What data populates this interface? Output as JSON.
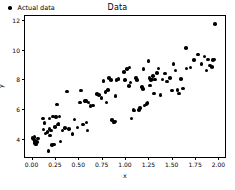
{
  "chart_data": {
    "type": "scatter",
    "title": "Data",
    "xlabel": "x",
    "ylabel": "y",
    "xlim": [
      -0.07,
      2.07
    ],
    "ylim": [
      2.75,
      12.3
    ],
    "grid": false,
    "legend": {
      "position": "upper left",
      "entries": [
        "Actual data"
      ]
    },
    "xticks": [
      0.0,
      0.25,
      0.5,
      0.75,
      1.0,
      1.25,
      1.5,
      1.75,
      2.0
    ],
    "xticklabels": [
      "0.00",
      "0.25",
      "0.50",
      "0.75",
      "1.00",
      "1.25",
      "1.50",
      "1.75",
      "2.00"
    ],
    "yticks": [
      4,
      6,
      8,
      10,
      12
    ],
    "yticklabels": [
      "4",
      "6",
      "8",
      "10",
      "12"
    ],
    "marker": "circle",
    "marker_color": "#000000",
    "series": [
      {
        "name": "Actual data",
        "x": [
          0.01,
          0.02,
          0.03,
          0.03,
          0.04,
          0.05,
          0.06,
          0.07,
          0.12,
          0.13,
          0.14,
          0.15,
          0.17,
          0.18,
          0.19,
          0.19,
          0.2,
          0.21,
          0.22,
          0.23,
          0.24,
          0.25,
          0.26,
          0.27,
          0.28,
          0.29,
          0.3,
          0.31,
          0.33,
          0.36,
          0.38,
          0.4,
          0.44,
          0.46,
          0.49,
          0.52,
          0.53,
          0.55,
          0.57,
          0.58,
          0.59,
          0.6,
          0.61,
          0.63,
          0.66,
          0.7,
          0.72,
          0.75,
          0.77,
          0.79,
          0.8,
          0.82,
          0.83,
          0.85,
          0.86,
          0.88,
          0.89,
          0.9,
          0.91,
          0.93,
          0.99,
          1.0,
          1.02,
          1.04,
          1.05,
          1.06,
          1.07,
          1.09,
          1.1,
          1.12,
          1.13,
          1.15,
          1.16,
          1.18,
          1.19,
          1.2,
          1.21,
          1.23,
          1.24,
          1.25,
          1.26,
          1.27,
          1.28,
          1.29,
          1.3,
          1.31,
          1.32,
          1.34,
          1.36,
          1.38,
          1.4,
          1.43,
          1.45,
          1.48,
          1.5,
          1.52,
          1.54,
          1.56,
          1.58,
          1.6,
          1.62,
          1.65,
          1.66,
          1.7,
          1.74,
          1.78,
          1.82,
          1.85,
          1.87,
          1.89,
          1.91,
          1.93,
          1.94,
          1.95,
          1.96
        ],
        "y": [
          4.05,
          3.95,
          4.1,
          3.7,
          3.85,
          3.6,
          3.75,
          4.0,
          5.35,
          4.6,
          5.05,
          4.35,
          4.45,
          3.15,
          5.35,
          4.65,
          4.2,
          4.55,
          3.55,
          5.5,
          3.6,
          4.8,
          5.45,
          6.3,
          4.95,
          5.0,
          5.5,
          3.8,
          4.55,
          4.7,
          7.2,
          4.65,
          4.3,
          5.3,
          4.75,
          6.45,
          7.25,
          4.95,
          6.55,
          6.55,
          5.1,
          4.55,
          6.45,
          6.2,
          6.25,
          7.0,
          6.95,
          6.75,
          7.9,
          7.15,
          6.45,
          7.3,
          8.1,
          7.95,
          5.25,
          5.1,
          5.15,
          6.9,
          7.95,
          8.05,
          8.5,
          7.95,
          8.7,
          7.55,
          8.8,
          7.8,
          5.35,
          5.95,
          5.9,
          8.1,
          7.95,
          5.95,
          6.05,
          7.5,
          7.35,
          8.7,
          6.25,
          6.35,
          6.4,
          9.25,
          8.1,
          7.6,
          7.95,
          8.0,
          8.25,
          7.05,
          8.0,
          8.45,
          8.75,
          6.95,
          8.0,
          8.4,
          7.85,
          8.1,
          7.25,
          9.05,
          8.6,
          7.3,
          7.05,
          8.05,
          7.4,
          10.15,
          8.75,
          8.8,
          9.3,
          9.7,
          9.05,
          9.55,
          8.6,
          9.35,
          8.95,
          8.85,
          9.3,
          9.35,
          11.75
        ]
      }
    ]
  }
}
